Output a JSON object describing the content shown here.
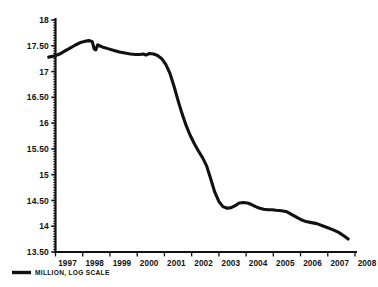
{
  "chart_data": {
    "type": "line",
    "title": "",
    "subtitle": "",
    "xlabel": "",
    "ylabel": "",
    "legend": [
      "MILLION, LOG SCALE"
    ],
    "legend_position": "bottom-left",
    "grid": false,
    "line_color": "#111111",
    "background_color": "#FFFFFF",
    "xlim": [
      1996.6,
      2008.35
    ],
    "ylim": [
      13.5,
      18.0
    ],
    "y_ticks": [
      13.5,
      14.0,
      14.5,
      15.0,
      15.5,
      16.0,
      16.5,
      17.0,
      17.5,
      18.0
    ],
    "y_tick_labels": [
      "13.50",
      "14",
      "14.50",
      "15",
      "15.50",
      "16",
      "16.50",
      "17",
      "17.50",
      "18"
    ],
    "y_minor_ticks_per_interval": 10,
    "x_ticks": [
      1997,
      1998,
      1999,
      2000,
      2001,
      2002,
      2003,
      2004,
      2005,
      2006,
      2007,
      2008
    ],
    "x_tick_labels": [
      "1997",
      "1998",
      "1999",
      "2000",
      "2001",
      "2002",
      "2003",
      "2004",
      "2005",
      "2006",
      "2007",
      "2008"
    ],
    "series": [
      {
        "name": "MILLION, LOG SCALE",
        "x": [
          1996.75,
          1996.95,
          1997.15,
          1997.35,
          1997.55,
          1997.75,
          1997.95,
          1998.1,
          1998.25,
          1998.35,
          1998.42,
          1998.48,
          1998.55,
          1998.62,
          1998.75,
          1998.95,
          1999.15,
          1999.35,
          1999.55,
          1999.75,
          1999.95,
          2000.1,
          2000.22,
          2000.32,
          2000.45,
          2000.6,
          2000.75,
          2000.9,
          2001.05,
          2001.2,
          2001.35,
          2001.5,
          2001.65,
          2001.8,
          2001.95,
          2002.1,
          2002.25,
          2002.4,
          2002.55,
          2002.7,
          2002.85,
          2003.0,
          2003.15,
          2003.3,
          2003.45,
          2003.6,
          2003.75,
          2003.9,
          2004.05,
          2004.2,
          2004.35,
          2004.5,
          2004.65,
          2004.8,
          2004.95,
          2005.1,
          2005.3,
          2005.5,
          2005.7,
          2005.9,
          2006.05,
          2006.2,
          2006.4,
          2006.6,
          2006.8,
          2007.0,
          2007.2,
          2007.4,
          2007.6,
          2007.75
        ],
        "y": [
          17.28,
          17.3,
          17.34,
          17.4,
          17.46,
          17.52,
          17.57,
          17.59,
          17.6,
          17.58,
          17.44,
          17.42,
          17.52,
          17.5,
          17.47,
          17.44,
          17.41,
          17.38,
          17.36,
          17.34,
          17.33,
          17.33,
          17.34,
          17.32,
          17.35,
          17.34,
          17.31,
          17.25,
          17.14,
          16.97,
          16.72,
          16.44,
          16.18,
          15.95,
          15.76,
          15.6,
          15.46,
          15.33,
          15.17,
          14.92,
          14.66,
          14.48,
          14.38,
          14.35,
          14.36,
          14.4,
          14.45,
          14.46,
          14.45,
          14.42,
          14.38,
          14.35,
          14.33,
          14.32,
          14.32,
          14.31,
          14.3,
          14.28,
          14.22,
          14.16,
          14.12,
          14.09,
          14.07,
          14.05,
          14.01,
          13.97,
          13.93,
          13.88,
          13.81,
          13.75
        ]
      }
    ]
  }
}
